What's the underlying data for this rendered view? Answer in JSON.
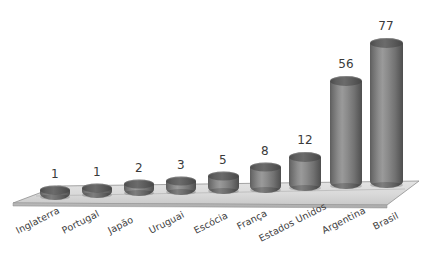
{
  "chart_data": {
    "type": "bar",
    "title": "",
    "subtitle": "",
    "xlabel": "",
    "ylabel": "",
    "grid": false,
    "legend": "none",
    "style": "3d-cylinder",
    "ylim": [
      0,
      77
    ],
    "categories": [
      "Inglaterra",
      "Portugal",
      "Japão",
      "Uruguai",
      "Escócia",
      "França",
      "Estados Unidos",
      "Argentina",
      "Brasil"
    ],
    "values": [
      1,
      1,
      2,
      3,
      5,
      8,
      12,
      56,
      77
    ],
    "value_labels": [
      "1",
      "1",
      "2",
      "3",
      "5",
      "8",
      "12",
      "56",
      "77"
    ],
    "colors": {
      "bar": "#7a7a7a",
      "bar_dark": "#4e4e4e",
      "bar_light": "#9a9a9a",
      "cap": "#5a5a5a",
      "floor": "#d8d8d8",
      "floor_edge": "#9a9a9a",
      "text": "#3a3a3a",
      "background": "#ffffff"
    }
  },
  "bars": [
    {
      "label": "Inglaterra",
      "value": "1",
      "x": 55,
      "w": 30,
      "h": 10,
      "top": 190,
      "cap_h": 9,
      "lx": 55,
      "ly": 167,
      "tx": 14,
      "ty": 226
    },
    {
      "label": "Portugal",
      "value": "1",
      "x": 97,
      "w": 30,
      "h": 10,
      "top": 188,
      "cap_h": 9,
      "lx": 97,
      "ly": 165,
      "tx": 60,
      "ty": 226
    },
    {
      "label": "Japão",
      "value": "2",
      "x": 139,
      "w": 30,
      "h": 12,
      "top": 184,
      "cap_h": 9,
      "lx": 139,
      "ly": 161,
      "tx": 106,
      "ty": 226
    },
    {
      "label": "Uruguai",
      "value": "3",
      "x": 181,
      "w": 30,
      "h": 14,
      "top": 181,
      "cap_h": 9,
      "lx": 181,
      "ly": 158,
      "tx": 147,
      "ty": 226
    },
    {
      "label": "Escócia",
      "value": "5",
      "x": 223,
      "w": 31,
      "h": 18,
      "top": 176,
      "cap_h": 9,
      "lx": 223,
      "ly": 153,
      "tx": 192,
      "ty": 226
    },
    {
      "label": "França",
      "value": "8",
      "x": 265,
      "w": 31,
      "h": 26,
      "top": 167,
      "cap_h": 9,
      "lx": 265,
      "ly": 144,
      "tx": 235,
      "ty": 222
    },
    {
      "label": "Estados Unidos",
      "value": "12",
      "x": 305,
      "w": 32,
      "h": 34,
      "top": 157,
      "cap_h": 10,
      "lx": 305,
      "ly": 133,
      "tx": 257,
      "ty": 234
    },
    {
      "label": "Argentina",
      "value": "56",
      "x": 346,
      "w": 32,
      "h": 108,
      "top": 81,
      "cap_h": 10,
      "lx": 346,
      "ly": 57,
      "tx": 320,
      "ty": 226
    },
    {
      "label": "Brasil",
      "value": "77",
      "x": 386,
      "w": 33,
      "h": 145,
      "top": 43,
      "cap_h": 10,
      "lx": 386,
      "ly": 19,
      "tx": 371,
      "ty": 222
    }
  ],
  "floor": {
    "name": "chart-floor-platform",
    "points": "12,202 64,186 418,182 386,204",
    "top_face": "12,202 64,186 418,182 386,204"
  }
}
